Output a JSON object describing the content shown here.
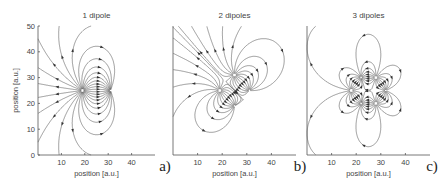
{
  "chart_data": [
    {
      "type": "streamline",
      "title": "1 dipole",
      "panel_label": "a)",
      "xlabel": "position [a.u.]",
      "ylabel": "position [a.u.]",
      "xlim": [
        0,
        50
      ],
      "ylim": [
        0,
        50
      ],
      "xticks": [
        10,
        20,
        30,
        40
      ],
      "yticks": [
        0,
        10,
        20,
        30,
        40,
        50
      ],
      "charges": [
        {
          "x": 19,
          "y": 25,
          "sign": 1
        },
        {
          "x": 31,
          "y": 25,
          "sign": -1
        }
      ]
    },
    {
      "type": "streamline",
      "title": "2 dipoles",
      "panel_label": "b)",
      "xlabel": "position [a.u.]",
      "ylabel": "",
      "xlim": [
        0,
        50
      ],
      "ylim": [
        0,
        50
      ],
      "xticks": [
        10,
        20,
        30,
        40
      ],
      "yticks": [],
      "charges": [
        {
          "x": 19,
          "y": 25,
          "sign": 1
        },
        {
          "x": 31,
          "y": 25,
          "sign": -1
        },
        {
          "x": 25,
          "y": 31,
          "sign": 1
        },
        {
          "x": 25,
          "y": 19,
          "sign": -1
        }
      ]
    },
    {
      "type": "streamline",
      "title": "3 dipoles",
      "panel_label": "c)",
      "xlabel": "position [a.u.]",
      "ylabel": "",
      "xlim": [
        0,
        50
      ],
      "ylim": [
        0,
        50
      ],
      "xticks": [
        10,
        20,
        30,
        40
      ],
      "yticks": [],
      "charges": [
        {
          "x": 18,
          "y": 25,
          "sign": 1
        },
        {
          "x": 32,
          "y": 25,
          "sign": -1
        },
        {
          "x": 22,
          "y": 30,
          "sign": -1
        },
        {
          "x": 28,
          "y": 20,
          "sign": 1
        },
        {
          "x": 28,
          "y": 30,
          "sign": 1
        },
        {
          "x": 22,
          "y": 20,
          "sign": -1
        }
      ]
    }
  ]
}
